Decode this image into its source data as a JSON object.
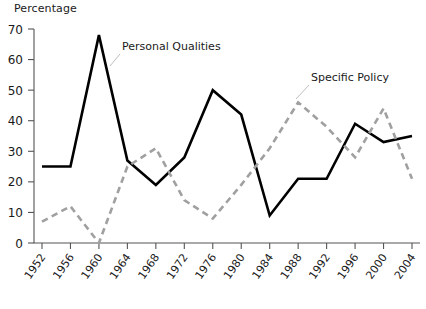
{
  "chart_data": {
    "type": "line",
    "title": "",
    "ylabel": "Percentage",
    "xlabel": "",
    "ylim": [
      0,
      70
    ],
    "ytick_values": [
      0,
      10,
      20,
      30,
      40,
      50,
      60,
      70
    ],
    "ytick_labels": [
      "0",
      "10",
      "20",
      "30",
      "40",
      "50",
      "60",
      "70"
    ],
    "grid": false,
    "legend_position": "inline-annotations",
    "categories": [
      "1952",
      "1956",
      "1960",
      "1964",
      "1968",
      "1972",
      "1976",
      "1980",
      "1984",
      "1988",
      "1992",
      "1996",
      "2000",
      "2004"
    ],
    "series": [
      {
        "name": "Personal Qualities",
        "style": "solid",
        "color": "#000000",
        "values": [
          25,
          25,
          68,
          27,
          19,
          28,
          50,
          42,
          9,
          21,
          21,
          39,
          33,
          35
        ]
      },
      {
        "name": "Specific Policy",
        "style": "dashed",
        "color": "#a0a0a0",
        "values": [
          7,
          12,
          0,
          25,
          31,
          14,
          8,
          19,
          31,
          46,
          38,
          28,
          44,
          21
        ]
      }
    ],
    "annotations": [
      {
        "text": "Personal Qualities",
        "x_px": 122,
        "y_px": 50
      },
      {
        "text": "Specific Policy",
        "x_px": 311,
        "y_px": 81
      }
    ]
  }
}
